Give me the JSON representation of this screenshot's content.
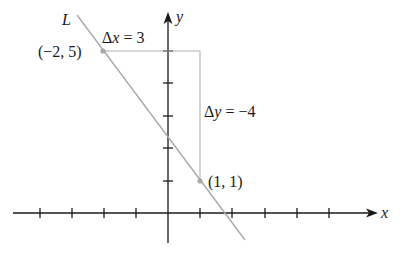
{
  "diagram": {
    "type": "coordinate-line-slope",
    "colors": {
      "axis": "#1a1a1a",
      "line": "#aaaaaa",
      "guide": "#b0b0b0",
      "point": "#a8a8a8",
      "text": "#1a1a1a"
    },
    "axes": {
      "x_label": "x",
      "y_label": "y",
      "x_ticks": [
        -4,
        -3,
        -2,
        -1,
        1,
        2,
        3,
        4,
        5
      ],
      "y_ticks": [
        1,
        2,
        3,
        4,
        5
      ]
    },
    "line": {
      "label": "L",
      "slope": "-4/3"
    },
    "points": [
      {
        "label": "(−2, 5)",
        "x": -2,
        "y": 5
      },
      {
        "label": "(1, 1)",
        "x": 1,
        "y": 1
      }
    ],
    "annotations": {
      "delta_x": {
        "symbol": "Δ",
        "var": "x",
        "eq": " = 3"
      },
      "delta_y": {
        "symbol": "Δ",
        "var": "y",
        "eq": " = −4"
      }
    }
  }
}
